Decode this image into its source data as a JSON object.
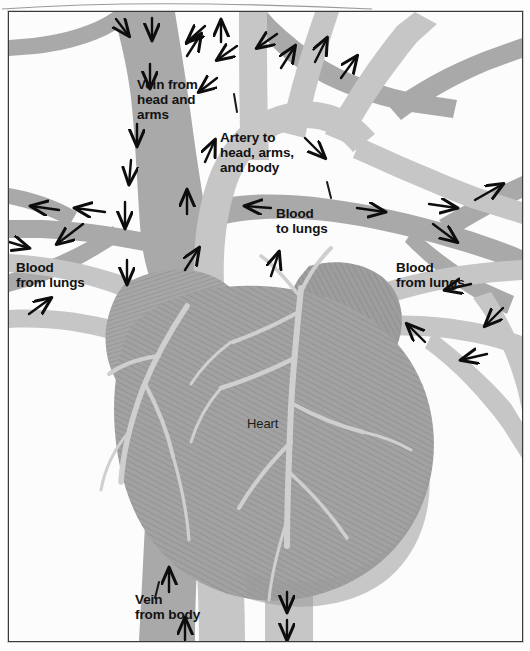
{
  "figure": {
    "type": "anatomical-diagram"
  },
  "colors": {
    "deoxygenated_vessel": "#a9a9a9",
    "oxygenated_vessel": "#c6c6c6",
    "heart_muscle": "#a2a2a2",
    "coronary_vessel": "#cfcfcf",
    "arrow": "#0d0d0d",
    "background": "#fdfdfd",
    "frame_border": "#3a3a3a",
    "label_text": "#121212"
  },
  "labels": {
    "vein_head_arms": "Vein from\nhead and\narms",
    "artery_head_arms_body": "Artery to\nhead, arms,\nand body",
    "blood_to_lungs": "Blood\nto lungs",
    "blood_from_lungs_left": "Blood\nfrom lungs",
    "blood_from_lungs_right": "Blood\nfrom lungs",
    "heart": "Heart",
    "vein_from_body": "Vein\nfrom body"
  },
  "flow_arrows": {
    "count": 38,
    "description": "Black directional arrows indicating blood flow through vessels"
  }
}
